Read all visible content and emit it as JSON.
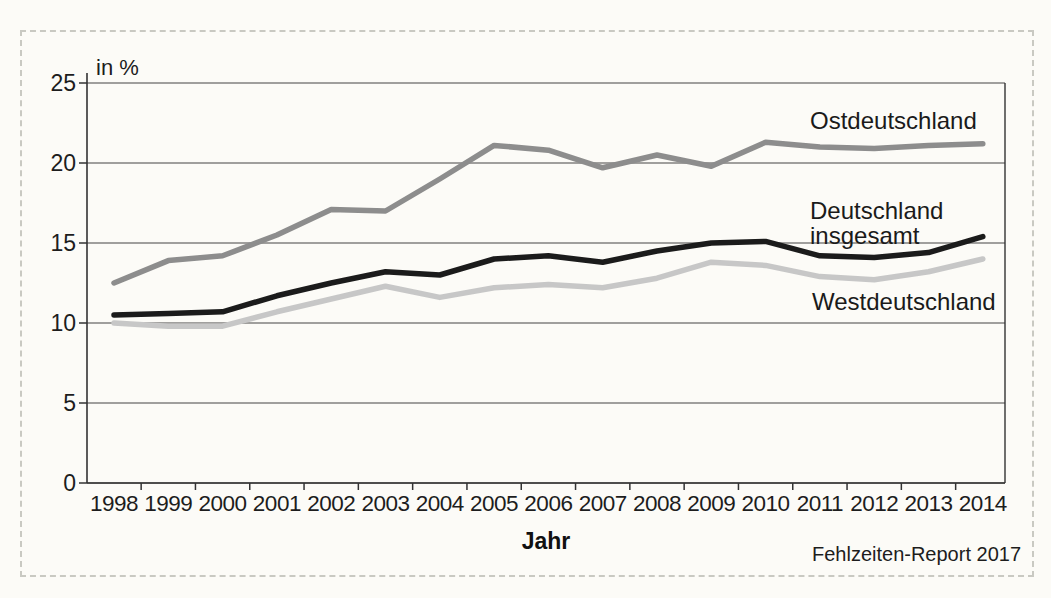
{
  "chart_data": {
    "type": "line",
    "title": "",
    "ylabel": "in %",
    "xlabel": "Jahr",
    "source": "Fehlzeiten-Report 2017",
    "ylim": [
      0,
      25
    ],
    "yticks": [
      0,
      5,
      10,
      15,
      20,
      25
    ],
    "grid": true,
    "legend_position": "inline-annotations-right",
    "categories": [
      "1998",
      "1999",
      "2000",
      "2001",
      "2002",
      "2003",
      "2004",
      "2005",
      "2006",
      "2007",
      "2008",
      "2009",
      "2010",
      "2011",
      "2012",
      "2013",
      "2014"
    ],
    "series": [
      {
        "name": "Ostdeutschland",
        "color": "#8d8d8d",
        "values": [
          12.5,
          13.9,
          14.2,
          15.5,
          17.1,
          17.0,
          19.0,
          21.1,
          20.8,
          19.7,
          20.5,
          19.8,
          21.3,
          21.0,
          20.9,
          21.1,
          21.2
        ]
      },
      {
        "name": "Deutschland insgesamt",
        "color": "#1b1b1b",
        "values": [
          10.5,
          10.6,
          10.7,
          11.7,
          12.5,
          13.2,
          13.0,
          14.0,
          14.2,
          13.8,
          14.5,
          15.0,
          15.1,
          14.2,
          14.1,
          14.4,
          15.4
        ]
      },
      {
        "name": "Westdeutschland",
        "color": "#c7c7c7",
        "values": [
          10.0,
          9.8,
          9.8,
          10.7,
          11.5,
          12.3,
          11.6,
          12.2,
          12.4,
          12.2,
          12.8,
          13.8,
          13.6,
          12.9,
          12.7,
          13.2,
          14.0
        ]
      }
    ],
    "axis_color": "#333333",
    "grid_color": "#454545",
    "frame_color": "#c9c9c2"
  }
}
